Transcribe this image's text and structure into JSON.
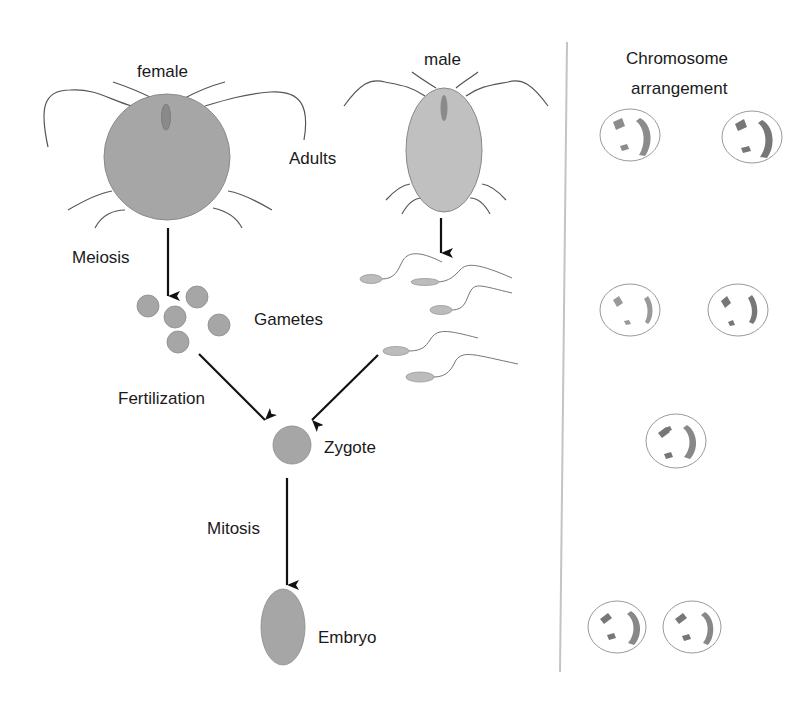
{
  "labels": {
    "female": "female",
    "male": "male",
    "adults": "Adults",
    "meiosis": "Meiosis",
    "gametes": "Gametes",
    "fertilization": "Fertilization",
    "zygote": "Zygote",
    "mitosis": "Mitosis",
    "embryo": "Embryo",
    "chromosome_title_line1": "Chromosome",
    "chromosome_title_line2": "arrangement"
  },
  "colors": {
    "cell_fill": "#a8a8a8",
    "cell_fill_light": "#c4c4c4",
    "line": "#555555",
    "arrow": "#111111",
    "divider": "#bdbdbd",
    "chromosome": "#888888",
    "nucleus_outline": "#9a9a9a"
  },
  "chromosome_rows": [
    {
      "stage": "Adults",
      "cells": 2
    },
    {
      "stage": "Gametes",
      "cells": 2
    },
    {
      "stage": "Zygote",
      "cells": 1
    },
    {
      "stage": "Embryo",
      "cells": 2
    }
  ]
}
